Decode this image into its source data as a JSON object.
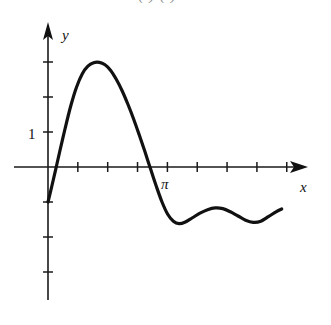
{
  "figure": {
    "background_color": "#ffffff",
    "ink_color": "#111111",
    "clipped_top_text": "( )    ( )    ="
  },
  "chart_data": {
    "type": "line",
    "title": "",
    "subtitle": "",
    "xlabel": "x",
    "ylabel": "y",
    "grid": false,
    "legend": false,
    "xlim": [
      -0.35,
      7.9
    ],
    "ylim": [
      -3.6,
      3.6
    ],
    "x_tick_labels": [
      "",
      "",
      "",
      "π",
      "",
      "",
      "",
      ""
    ],
    "x_tick_values": [
      0.785,
      1.571,
      2.356,
      3.142,
      3.927,
      4.712,
      5.498,
      6.283
    ],
    "y_tick_labels": [
      "3",
      "2",
      "1",
      "-1",
      "-2",
      "-3"
    ],
    "y_tick_values": [
      3,
      2,
      1,
      -1,
      -2,
      -3
    ],
    "y_visible_tick_labels": [
      "1"
    ],
    "annotations": [
      {
        "text": "π",
        "x": 3.142,
        "y": -0.45
      },
      {
        "text": "1",
        "x": -0.3,
        "y": 1.0
      },
      {
        "text": "x",
        "x": 7.6,
        "y": -0.5
      },
      {
        "text": "y",
        "x": 0.25,
        "y": 3.45
      }
    ],
    "series": [
      {
        "name": "f",
        "color": "#111111",
        "linewidth": 3.2,
        "points": [
          [
            0.0,
            -1.0
          ],
          [
            0.1,
            -0.55
          ],
          [
            0.2,
            -0.08
          ],
          [
            0.3,
            0.4
          ],
          [
            0.45,
            1.1
          ],
          [
            0.6,
            1.75
          ],
          [
            0.75,
            2.28
          ],
          [
            0.9,
            2.66
          ],
          [
            1.05,
            2.88
          ],
          [
            1.2,
            2.98
          ],
          [
            1.35,
            2.99
          ],
          [
            1.5,
            2.92
          ],
          [
            1.65,
            2.76
          ],
          [
            1.8,
            2.5
          ],
          [
            1.95,
            2.18
          ],
          [
            2.1,
            1.8
          ],
          [
            2.25,
            1.38
          ],
          [
            2.4,
            0.92
          ],
          [
            2.55,
            0.44
          ],
          [
            2.7,
            -0.06
          ],
          [
            2.85,
            -0.55
          ],
          [
            3.0,
            -1.0
          ],
          [
            3.15,
            -1.35
          ],
          [
            3.3,
            -1.55
          ],
          [
            3.45,
            -1.62
          ],
          [
            3.6,
            -1.58
          ],
          [
            3.8,
            -1.45
          ],
          [
            4.0,
            -1.32
          ],
          [
            4.2,
            -1.22
          ],
          [
            4.4,
            -1.17
          ],
          [
            4.6,
            -1.19
          ],
          [
            4.8,
            -1.28
          ],
          [
            5.0,
            -1.4
          ],
          [
            5.2,
            -1.52
          ],
          [
            5.4,
            -1.58
          ],
          [
            5.6,
            -1.55
          ],
          [
            5.8,
            -1.42
          ],
          [
            6.0,
            -1.28
          ],
          [
            6.15,
            -1.2
          ]
        ]
      }
    ]
  },
  "axes_meta": {
    "y_axis_arrow": true,
    "x_axis_arrow": true,
    "tick_length": 5
  }
}
